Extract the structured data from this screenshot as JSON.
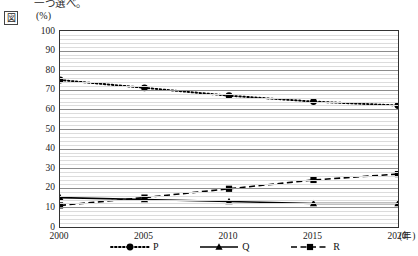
{
  "header": {
    "instruction_text": "一つ選べ。",
    "figure_label": "図",
    "unit_label": "(%)",
    "x_unit_label": "(年)"
  },
  "chart_data": {
    "type": "line",
    "title": "",
    "subtitle": "",
    "xlabel": "(年)",
    "ylabel": "(%)",
    "categories": [
      "2000",
      "2005",
      "2010",
      "2015",
      "2020"
    ],
    "x": [
      2000,
      2005,
      2010,
      2015,
      2020
    ],
    "xlim": [
      2000,
      2020
    ],
    "ylim": [
      0,
      100
    ],
    "y_ticks": [
      0,
      10,
      20,
      30,
      40,
      50,
      60,
      70,
      80,
      90,
      100
    ],
    "y_tick_labels": [
      "0",
      "10",
      "20",
      "30",
      "40",
      "50",
      "60",
      "70",
      "80",
      "90",
      "100"
    ],
    "grid": true,
    "minor_grid": true,
    "minor_grid_step": 2,
    "legend_position": "below",
    "series": [
      {
        "name": "P",
        "values": [
          75,
          71,
          67,
          64,
          62
        ],
        "line_style": "dotted",
        "marker": "circle",
        "color": "#000000"
      },
      {
        "name": "Q",
        "values": [
          15,
          14,
          13,
          12,
          12
        ],
        "line_style": "solid",
        "marker": "triangle",
        "color": "#000000"
      },
      {
        "name": "R",
        "values": [
          11,
          15,
          19.5,
          24,
          27
        ],
        "line_style": "dashed",
        "marker": "square",
        "color": "#000000"
      }
    ]
  },
  "legend": [
    {
      "label": "P",
      "style": "dotted",
      "marker": "circle"
    },
    {
      "label": "Q",
      "style": "solid",
      "marker": "triangle"
    },
    {
      "label": "R",
      "style": "dashed",
      "marker": "square"
    }
  ]
}
